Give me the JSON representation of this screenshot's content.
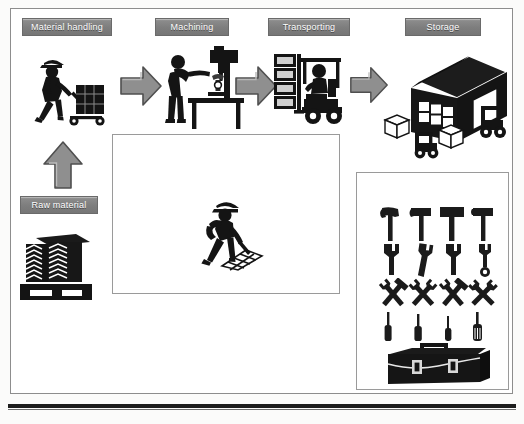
{
  "diagram": {
    "frame_border_color": "#8d8d8d",
    "label_fill_color": "#7d7d7d",
    "label_text_color": "#ffffff",
    "arrow_fill_color": "#8f8f8f",
    "icon_color": "#1b1b1b"
  },
  "stations": [
    {
      "id": "material-handling",
      "label": "Material handling",
      "icon": "worker-pushing-hand-truck-icon"
    },
    {
      "id": "machining",
      "label": "Machining",
      "icon": "worker-at-drill-press-icon"
    },
    {
      "id": "transporting",
      "label": "Transporting",
      "icon": "forklift-with-pallet-stack-icon"
    },
    {
      "id": "storage",
      "label": "Storage",
      "icon": "warehouse-with-forklifts-icon"
    },
    {
      "id": "raw-material",
      "label": "Raw material",
      "icon": "stacked-angle-bars-on-pallet-icon"
    },
    {
      "id": "cleaning",
      "label": "Cleaning",
      "icon": "worker-sweeping-icon"
    },
    {
      "id": "tool-storage-area",
      "label": "Tool storage area",
      "icon": "toolbox-and-hand-tools-icon"
    }
  ],
  "flow_arrows": [
    {
      "id": "arrow-raw-to-material-handling",
      "direction": "up",
      "from": "raw-material",
      "to": "material-handling"
    },
    {
      "id": "arrow-material-to-machining",
      "direction": "right",
      "from": "material-handling",
      "to": "machining"
    },
    {
      "id": "arrow-machining-to-transporting",
      "direction": "right",
      "from": "machining",
      "to": "transporting"
    },
    {
      "id": "arrow-transporting-to-storage",
      "direction": "right",
      "from": "transporting",
      "to": "storage"
    }
  ],
  "tool_rack": {
    "rows": [
      {
        "id": "hammer-row",
        "items": [
          "claw-hammer-icon",
          "claw-hammer-icon",
          "sledge-hammer-icon",
          "mallet-icon"
        ]
      },
      {
        "id": "wrench-row",
        "items": [
          "open-end-wrench-icon",
          "adjustable-wrench-icon",
          "combination-wrench-icon",
          "ring-spanner-icon"
        ]
      },
      {
        "id": "crossed-tool-row",
        "items": [
          "crossed-hammer-wrench-icon",
          "crossed-wrenches-icon",
          "crossed-spanner-hammer-icon",
          "crossed-spanners-icon"
        ]
      },
      {
        "id": "screwdriver-row",
        "items": [
          "flathead-screwdriver-icon",
          "phillips-screwdriver-icon",
          "precision-screwdriver-icon",
          "stubby-screwdriver-icon"
        ]
      }
    ],
    "toolbox": "toolbox-icon"
  }
}
